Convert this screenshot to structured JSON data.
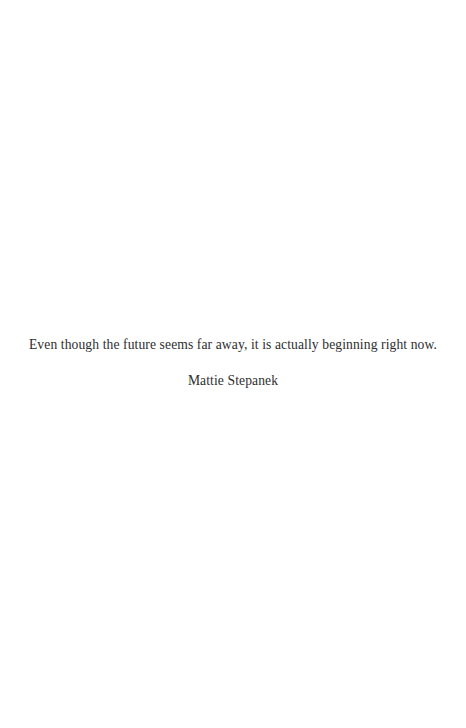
{
  "quote": {
    "text": "Even though the future seems far away, it is actually beginning right now.",
    "author": "Mattie Stepanek"
  },
  "colors": {
    "background": "#ffffff",
    "text": "#2e2e2e"
  }
}
